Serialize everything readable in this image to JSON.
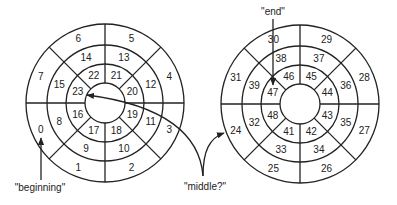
{
  "colors": {
    "ink": "#222222",
    "background": "#ffffff"
  },
  "geometry": {
    "rings_radii": [
      20,
      39,
      58,
      79
    ],
    "sectors": 8
  },
  "disks": [
    {
      "name": "left-disk",
      "cx": 105,
      "cy": 103,
      "rings": {
        "outer": [
          "6",
          "5",
          "4",
          "3",
          "2",
          "1",
          "0",
          "7"
        ],
        "middle": [
          "14",
          "13",
          "12",
          "11",
          "10",
          "9",
          "8",
          "15"
        ],
        "inner": [
          "22",
          "21",
          "20",
          "19",
          "18",
          "17",
          "16",
          "23"
        ]
      }
    },
    {
      "name": "right-disk",
      "cx": 300,
      "cy": 104,
      "rings": {
        "outer": [
          "30",
          "29",
          "28",
          "27",
          "26",
          "25",
          "24",
          "31"
        ],
        "middle": [
          "38",
          "37",
          "36",
          "35",
          "34",
          "33",
          "32",
          "39"
        ],
        "inner": [
          "46",
          "45",
          "44",
          "43",
          "42",
          "41",
          "48",
          "47"
        ]
      }
    }
  ],
  "annotations": {
    "beginning": "\"beginning\"",
    "middle": "\"middle?\"",
    "end": "\"end\""
  }
}
